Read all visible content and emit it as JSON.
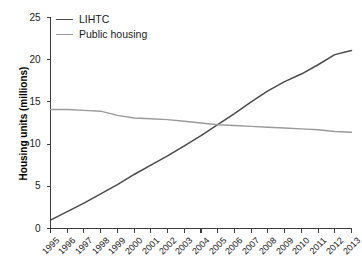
{
  "chart_data": {
    "type": "line",
    "title": "",
    "xlabel": "",
    "ylabel": "Housing units (millions)",
    "ylim": [
      0,
      25
    ],
    "yticks": [
      0,
      5,
      10,
      15,
      20,
      25
    ],
    "grid": false,
    "legend_position": "top-left",
    "categories": [
      "1995",
      "1996",
      "1997",
      "1998",
      "1999",
      "2000",
      "2001",
      "2002",
      "2003",
      "2004",
      "2005",
      "2006",
      "2007",
      "2008",
      "2009",
      "2010",
      "2011",
      "2012",
      "2013"
    ],
    "series": [
      {
        "name": "LIHTC",
        "color": "#4a4a4a",
        "values": [
          1.0,
          2.0,
          3.0,
          4.1,
          5.2,
          6.4,
          7.5,
          8.6,
          9.8,
          11.0,
          12.3,
          13.6,
          15.0,
          16.3,
          17.4,
          18.3,
          19.4,
          20.6,
          21.1
        ]
      },
      {
        "name": "Public housing",
        "color": "#9a9a9a",
        "values": [
          14.1,
          14.1,
          14.0,
          13.9,
          13.4,
          13.1,
          13.0,
          12.9,
          12.7,
          12.5,
          12.3,
          12.2,
          12.1,
          12.0,
          11.9,
          11.8,
          11.7,
          11.5,
          11.4
        ]
      }
    ],
    "annotations": {
      "crossover_year": "2005",
      "crossover_value": "12.3"
    }
  },
  "legend": {
    "items": [
      {
        "label": "LIHTC"
      },
      {
        "label": "Public housing"
      }
    ]
  },
  "axis": {
    "y_title": "Housing units (millions)"
  }
}
